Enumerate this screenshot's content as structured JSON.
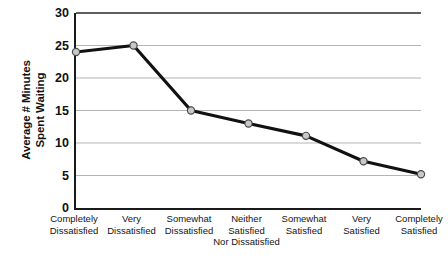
{
  "chart_data": {
    "type": "line",
    "title": "",
    "subtitle": "",
    "xlabel": "",
    "ylabel": "Average # Minutes Spent Waiting",
    "ylabel_lines": [
      "Average # Minutes",
      "Spent Waiting"
    ],
    "categories": [
      "Completely Dissatisfied",
      "Very Dissatisfied",
      "Somewhat Dissatisfied",
      "Neither Satisfied Nor Dissatisfied",
      "Somewhat Satisfied",
      "Very Satisfied",
      "Completely Satisfied"
    ],
    "category_label_lines": [
      [
        "Completely",
        "Dissatisfied"
      ],
      [
        "Very",
        "Dissatisfied"
      ],
      [
        "Somewhat",
        "Dissatisfied"
      ],
      [
        "Neither",
        "Satisfied",
        "Nor Dissatisfied"
      ],
      [
        "Somewhat",
        "Satisfied"
      ],
      [
        "Very",
        "Satisfied"
      ],
      [
        "Completely",
        "Satisfied"
      ]
    ],
    "values": [
      24,
      25,
      15,
      13,
      11.1,
      7.2,
      5.2
    ],
    "ylim": [
      0,
      30
    ],
    "yticks": [
      0,
      5,
      10,
      15,
      20,
      25,
      30
    ],
    "ytick_labels": [
      "0",
      "5",
      "10",
      "15",
      "20",
      "25",
      "30"
    ],
    "grid": "horizontal",
    "legend": "none",
    "series": [
      {
        "name": "Average # Minutes Spent Waiting",
        "values": [
          24,
          25,
          15,
          13,
          11.1,
          7.2,
          5.2
        ]
      }
    ],
    "colors": {
      "line": "#111111",
      "marker_fill": "#c8c8c8",
      "marker_edge": "#4a4a4a",
      "gridline": "#b4b4b4",
      "axis": "#1a1a1a",
      "background": "#ffffff"
    }
  }
}
